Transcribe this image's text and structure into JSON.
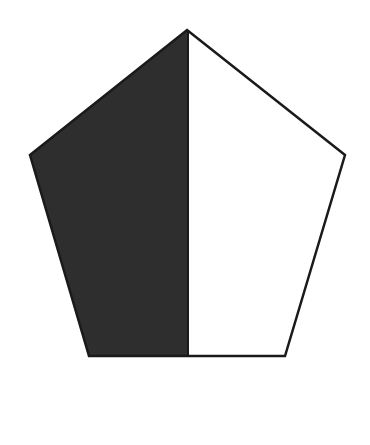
{
  "figure": {
    "shape": "pentagon",
    "colors": {
      "background": "#ffffff",
      "stroke": "#1a1a1a",
      "shaded_fill": "#2e2e2e",
      "unshaded_fill": "#ffffff"
    },
    "vertices": {
      "top": [
        187,
        30
      ],
      "right": [
        345,
        155
      ],
      "bottom_right": [
        285,
        356
      ],
      "bottom_left": [
        89,
        356
      ],
      "left": [
        30,
        155
      ]
    },
    "divider_x": 188,
    "shaded_fraction": "1/2",
    "shaded_side": "left"
  }
}
